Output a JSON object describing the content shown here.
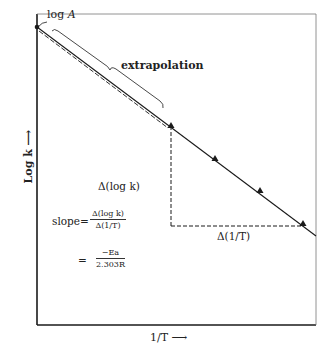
{
  "diagram": {
    "type": "arrhenius-plot",
    "frame": {
      "left": 37,
      "top": 14,
      "right": 316,
      "bottom": 325
    },
    "line": {
      "x1": 37,
      "y1": 27,
      "x2": 316,
      "y2": 236
    },
    "extrapolated_segment_end": {
      "x": 171,
      "y": 126
    },
    "data_points": [
      {
        "x": 171,
        "y": 126
      },
      {
        "x": 215,
        "y": 159
      },
      {
        "x": 260,
        "y": 191
      },
      {
        "x": 303,
        "y": 224
      }
    ],
    "triangle": {
      "corner_x": 171,
      "corner_y": 226,
      "top_y": 126,
      "right_x": 303
    },
    "labels": {
      "intercept_prefix": "log ",
      "intercept_var": "A",
      "extrapolation": "extrapolation",
      "y_axis": "Log k ⟶",
      "x_axis": "1/T ⟶",
      "delta_log_k": "Δ(log  k)",
      "delta_inv_t": "Δ(1/T)",
      "slope_label": "slope=",
      "slope_num": "Δ(log k)",
      "slope_den": "Δ(1/T)",
      "equals": "=",
      "ea_num": "−Ea",
      "ea_den": "2.303R"
    },
    "colors": {
      "ink": "#1a1a1a",
      "background": "#ffffff"
    }
  }
}
